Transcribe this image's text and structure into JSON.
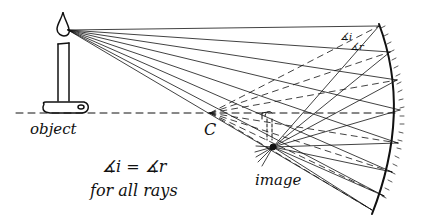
{
  "diagram": {
    "type": "concave-mirror-ray-diagram",
    "labels": {
      "object": "object",
      "center": "C",
      "image": "image",
      "law_line1": "∡i = ∡r",
      "law_line2": "for all rays",
      "angle_i": "∡i",
      "angle_r": "∡r"
    },
    "colors": {
      "ink": "#111111",
      "background": "#ffffff"
    },
    "source_point": [
      68,
      30
    ],
    "center_point": [
      210,
      113
    ],
    "image_point": [
      273,
      147
    ],
    "optical_axis_y": 113,
    "mirror": {
      "top": [
        379,
        24
      ],
      "mid": [
        401,
        112
      ],
      "bottom": [
        372,
        214
      ]
    },
    "rays_hit_points": [
      [
        379,
        26
      ],
      [
        390,
        52
      ],
      [
        397,
        80
      ],
      [
        400,
        110
      ],
      [
        398,
        143
      ],
      [
        392,
        172
      ],
      [
        384,
        196
      ],
      [
        372,
        210
      ]
    ]
  }
}
